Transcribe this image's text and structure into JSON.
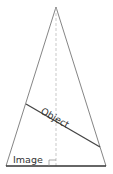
{
  "diagram": {
    "labels": {
      "object": "Object",
      "image": "Image"
    },
    "colors": {
      "outline": "#777777",
      "object_line": "#444444",
      "image_line": "#333333",
      "axis": "#bbbbbb",
      "text": "#333333"
    }
  }
}
